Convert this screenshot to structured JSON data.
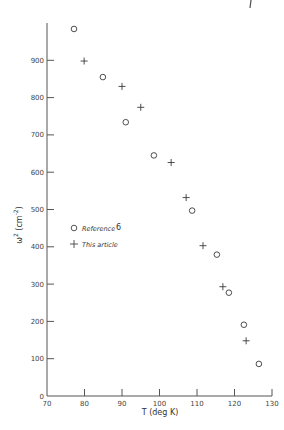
{
  "chart_data": {
    "type": "scatter",
    "title": "",
    "xlabel": "T (deg K)",
    "ylabel": "ω² (cm⁻²)",
    "xlim": [
      70,
      130
    ],
    "ylim": [
      0,
      1000
    ],
    "x_ticks": [
      70,
      80,
      90,
      100,
      110,
      120,
      130
    ],
    "y_ticks": [
      0,
      100,
      200,
      300,
      400,
      500,
      600,
      700,
      800,
      900
    ],
    "grid": false,
    "legend_position": "left-middle",
    "series": [
      {
        "name": "Reference 6",
        "marker": "circle",
        "points": [
          {
            "x": 77.2,
            "y": 984
          },
          {
            "x": 84.9,
            "y": 855
          },
          {
            "x": 91.0,
            "y": 734
          },
          {
            "x": 98.5,
            "y": 645
          },
          {
            "x": 108.7,
            "y": 497
          },
          {
            "x": 115.3,
            "y": 379
          },
          {
            "x": 118.5,
            "y": 277
          },
          {
            "x": 122.5,
            "y": 191
          },
          {
            "x": 126.5,
            "y": 86
          }
        ]
      },
      {
        "name": "This article",
        "marker": "plus",
        "points": [
          {
            "x": 79.9,
            "y": 898
          },
          {
            "x": 90.0,
            "y": 830
          },
          {
            "x": 95.0,
            "y": 774
          },
          {
            "x": 103.1,
            "y": 626
          },
          {
            "x": 107.1,
            "y": 532
          },
          {
            "x": 111.6,
            "y": 403
          },
          {
            "x": 116.9,
            "y": 293
          },
          {
            "x": 123.1,
            "y": 148
          }
        ]
      }
    ]
  },
  "labels": {
    "xlabel": "T (deg K)",
    "ylabel_base": "ω",
    "ylabel_sup": "2",
    "ylabel_unit": "(cm",
    "ylabel_unit_sup": "-2",
    "ylabel_close": ")",
    "legend_ref": "Reference",
    "legend_ref_num": "6",
    "legend_this": "This article"
  },
  "colors": {
    "ink": "#3a3a3a",
    "background": "#ffffff"
  }
}
